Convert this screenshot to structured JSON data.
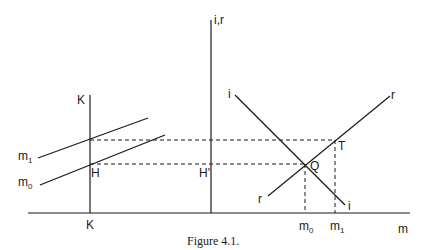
{
  "figure": {
    "caption": "Figure 4.1.",
    "axes": {
      "vertical_axis_label": "i,r",
      "horizontal_axis_label": "m",
      "k_axis_label_top": "K",
      "k_axis_label_bottom": "K"
    },
    "curves": {
      "m1": {
        "label": "m",
        "sub": "1"
      },
      "m0": {
        "label": "m",
        "sub": "0"
      },
      "i_top": "i",
      "i_bottom": "i",
      "r_top": "r",
      "r_bottom": "r"
    },
    "points": {
      "H": "H",
      "H_prime": "H'",
      "Q": "Q",
      "T": "T"
    },
    "ticks": {
      "m0": {
        "label": "m",
        "sub": "0"
      },
      "m1": {
        "label": "m",
        "sub": "1"
      }
    }
  }
}
